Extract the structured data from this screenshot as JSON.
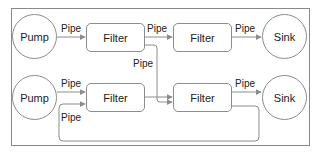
{
  "diagram": {
    "type": "pipe-and-filter",
    "colors": {
      "stroke": "#8c8c8c",
      "text": "#222222",
      "background": "#ffffff"
    },
    "rows": [
      {
        "nodes": [
          {
            "id": "pump1",
            "shape": "circle",
            "label": "Pump"
          },
          {
            "id": "filter1",
            "shape": "rounded-rect",
            "label": "Filter"
          },
          {
            "id": "filter2",
            "shape": "rounded-rect",
            "label": "Filter"
          },
          {
            "id": "sink1",
            "shape": "circle",
            "label": "Sink"
          }
        ]
      },
      {
        "nodes": [
          {
            "id": "pump2",
            "shape": "circle",
            "label": "Pump"
          },
          {
            "id": "filter3",
            "shape": "rounded-rect",
            "label": "Filter"
          },
          {
            "id": "filter4",
            "shape": "rounded-rect",
            "label": "Filter"
          },
          {
            "id": "sink2",
            "shape": "circle",
            "label": "Sink"
          }
        ]
      }
    ],
    "edges": [
      {
        "from": "pump1",
        "to": "filter1",
        "label": "Pipe"
      },
      {
        "from": "filter1",
        "to": "filter2",
        "label": "Pipe"
      },
      {
        "from": "filter2",
        "to": "sink1",
        "label": "Pipe"
      },
      {
        "from": "filter1",
        "to": "filter4",
        "label": "Pipe"
      },
      {
        "from": "pump2",
        "to": "filter3",
        "label": "Pipe"
      },
      {
        "from": "filter3",
        "to": "filter4",
        "label": ""
      },
      {
        "from": "filter4",
        "to": "sink2",
        "label": "Pipe"
      },
      {
        "from": "filter4",
        "to": "filter3",
        "label": "Pipe"
      }
    ]
  }
}
